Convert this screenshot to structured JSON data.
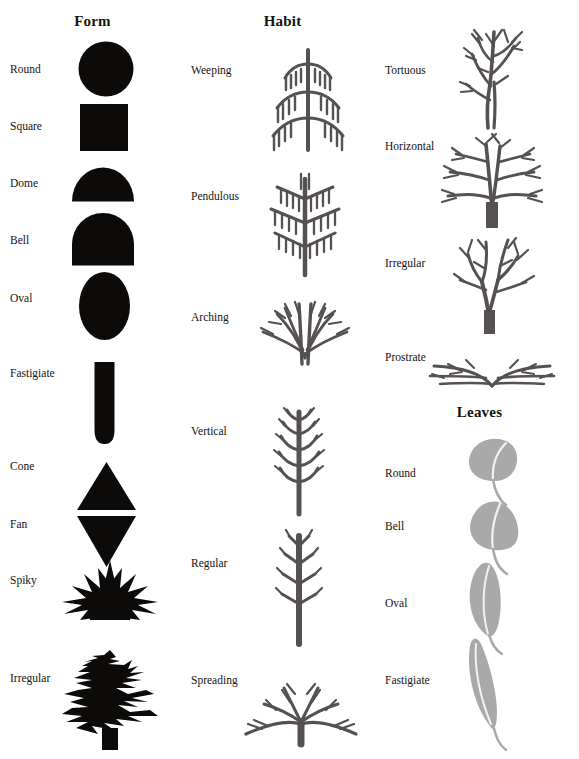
{
  "page": {
    "background_color": "#ffffff",
    "silhouette_color": "#0d0b09",
    "branch_color": "#555053",
    "leaf_color": "#a9a9a9",
    "text_color": "#16120f"
  },
  "columns": [
    {
      "id": "form",
      "header": "Form",
      "header_x": 110,
      "header_y": 22,
      "items": [
        {
          "label": "Round",
          "label_x": 10,
          "label_y": 70,
          "shape": "round-silhouette",
          "fig_x": 78,
          "fig_y": 41,
          "fig_w": 56,
          "fig_h": 56
        },
        {
          "label": "Square",
          "label_x": 10,
          "label_y": 127,
          "shape": "square-silhouette",
          "fig_x": 80,
          "fig_y": 104,
          "fig_w": 48,
          "fig_h": 47
        },
        {
          "label": "Dome",
          "label_x": 10,
          "label_y": 184,
          "shape": "dome-silhouette",
          "fig_x": 72,
          "fig_y": 165,
          "fig_w": 60,
          "fig_h": 36
        },
        {
          "label": "Bell",
          "label_x": 10,
          "label_y": 241,
          "shape": "bell-silhouette",
          "fig_x": 72,
          "fig_y": 214,
          "fig_w": 60,
          "fig_h": 52
        },
        {
          "label": "Oval",
          "label_x": 10,
          "label_y": 299,
          "shape": "oval-silhouette",
          "fig_x": 79,
          "fig_y": 273,
          "fig_w": 50,
          "fig_h": 67
        },
        {
          "label": "Fastigiate",
          "label_x": 10,
          "label_y": 374,
          "shape": "fastigiate-silhouette",
          "fig_x": 93,
          "fig_y": 363,
          "fig_w": 22,
          "fig_h": 80
        },
        {
          "label": "Cone",
          "label_x": 10,
          "label_y": 467,
          "shape": "cone-silhouette",
          "fig_x": 77,
          "fig_y": 463,
          "fig_w": 58,
          "fig_h": 47
        },
        {
          "label": "Fan",
          "label_x": 10,
          "label_y": 525,
          "shape": "fan-silhouette",
          "fig_x": 77,
          "fig_y": 516,
          "fig_w": 58,
          "fig_h": 50
        },
        {
          "label": "Spiky",
          "label_x": 10,
          "label_y": 581,
          "shape": "spiky-silhouette",
          "fig_x": 62,
          "fig_y": 566,
          "fig_w": 96,
          "fig_h": 54
        },
        {
          "label": "Irregular",
          "label_x": 10,
          "label_y": 679,
          "shape": "irregular-silhouette",
          "fig_x": 60,
          "fig_y": 651,
          "fig_w": 100,
          "fig_h": 98
        }
      ]
    },
    {
      "id": "habit",
      "header": "Habit",
      "header_x": 103,
      "header_y": 22,
      "items": [
        {
          "label": "Weeping",
          "label_x": 6,
          "label_y": 71,
          "shape": "weeping-tree",
          "fig_x": 70,
          "fig_y": 44,
          "fig_w": 108,
          "fig_h": 107
        },
        {
          "label": "Pendulous",
          "label_x": 6,
          "label_y": 197,
          "shape": "pendulous-tree",
          "fig_x": 76,
          "fig_y": 166,
          "fig_w": 90,
          "fig_h": 109
        },
        {
          "label": "Arching",
          "label_x": 6,
          "label_y": 318,
          "shape": "arching-tree",
          "fig_x": 72,
          "fig_y": 300,
          "fig_w": 96,
          "fig_h": 63
        },
        {
          "label": "Vertical",
          "label_x": 6,
          "label_y": 432,
          "shape": "vertical-tree",
          "fig_x": 82,
          "fig_y": 410,
          "fig_w": 64,
          "fig_h": 105
        },
        {
          "label": "Regular",
          "label_x": 6,
          "label_y": 564,
          "shape": "regular-tree",
          "fig_x": 82,
          "fig_y": 532,
          "fig_w": 64,
          "fig_h": 113
        },
        {
          "label": "Spreading",
          "label_x": 6,
          "label_y": 681,
          "shape": "spreading-tree",
          "fig_x": 58,
          "fig_y": 679,
          "fig_w": 116,
          "fig_h": 66
        }
      ]
    },
    {
      "id": "shape",
      "header": "Leaves",
      "header_x": 99,
      "header_y": 413,
      "items": [
        {
          "label": "Tortuous",
          "label_x": 5,
          "label_y": 71,
          "shape": "tortuous-tree",
          "fig_x": 75,
          "fig_y": 28,
          "fig_w": 72,
          "fig_h": 100
        },
        {
          "label": "Horizontal",
          "label_x": 5,
          "label_y": 147,
          "shape": "horizontal-tree",
          "fig_x": 56,
          "fig_y": 130,
          "fig_w": 110,
          "fig_h": 97
        },
        {
          "label": "Irregular",
          "label_x": 5,
          "label_y": 264,
          "shape": "irregular-tree",
          "fig_x": 65,
          "fig_y": 236,
          "fig_w": 96,
          "fig_h": 96
        },
        {
          "label": "Prostrate",
          "label_x": 5,
          "label_y": 358,
          "shape": "prostrate-tree",
          "fig_x": 50,
          "fig_y": 355,
          "fig_w": 126,
          "fig_h": 36
        },
        {
          "label": "Round",
          "label_x": 5,
          "label_y": 474,
          "shape": "round-leaf",
          "fig_x": 85,
          "fig_y": 438,
          "fig_w": 60,
          "fig_h": 72
        },
        {
          "label": "Bell",
          "label_x": 5,
          "label_y": 527,
          "shape": "bell-leaf",
          "fig_x": 85,
          "fig_y": 502,
          "fig_w": 60,
          "fig_h": 74
        },
        {
          "label": "Oval",
          "label_x": 5,
          "label_y": 604,
          "shape": "oval-leaf",
          "fig_x": 83,
          "fig_y": 563,
          "fig_w": 52,
          "fig_h": 94
        },
        {
          "label": "Fastigiate",
          "label_x": 5,
          "label_y": 681,
          "shape": "fastigiate-leaf",
          "fig_x": 80,
          "fig_y": 640,
          "fig_w": 56,
          "fig_h": 112
        }
      ]
    }
  ]
}
